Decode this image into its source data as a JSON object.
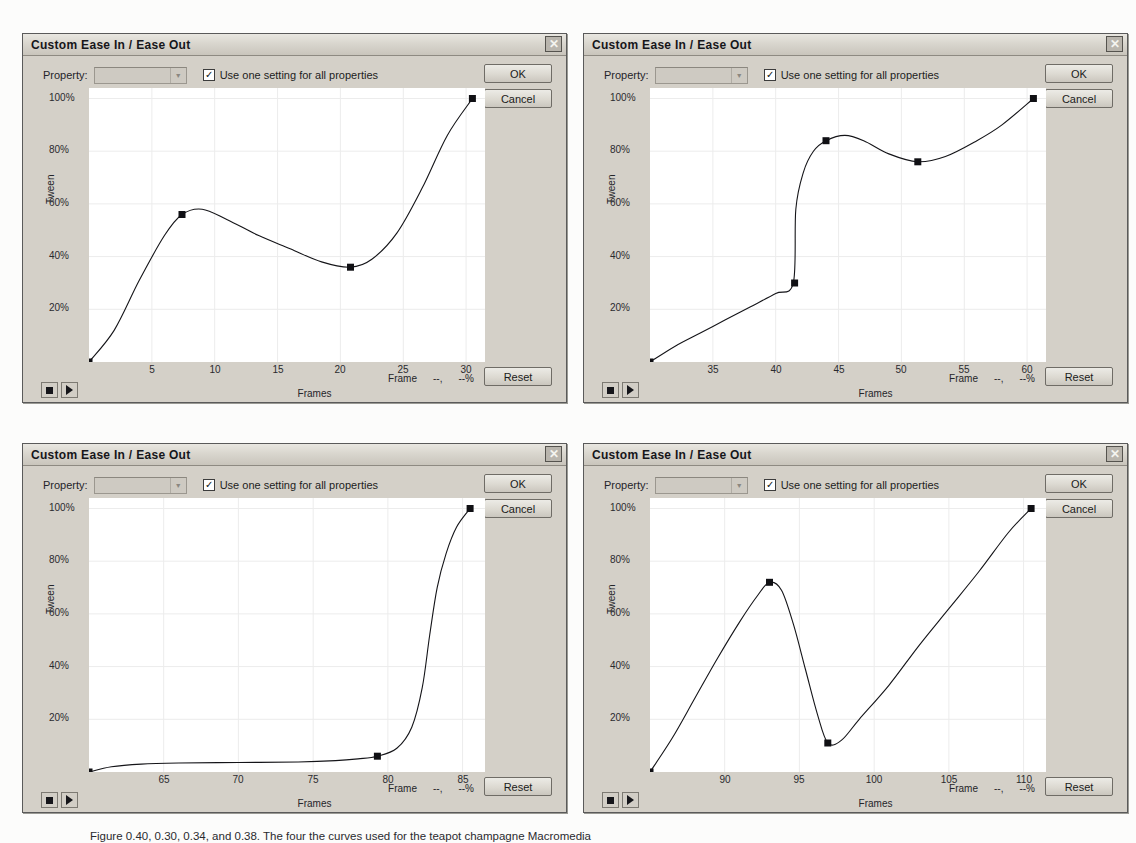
{
  "dialogs": [
    {
      "title": "Custom Ease In / Ease Out",
      "close_label": "✕",
      "property_label": "Property:",
      "property_value": "",
      "checkbox_label": "Use one setting for all properties",
      "checkbox_checked": true,
      "ok_label": "OK",
      "cancel_label": "Cancel",
      "reset_label": "Reset",
      "xlabel": "Frames",
      "ylabel": "Tween",
      "frame_readout_label": "Frame",
      "frame_readout_value": "--,",
      "percent_readout_value": "--%",
      "stop_icon": "stop-icon",
      "play_icon": "play-icon"
    },
    {
      "title": "Custom Ease In / Ease Out",
      "close_label": "✕",
      "property_label": "Property:",
      "property_value": "",
      "checkbox_label": "Use one setting for all properties",
      "checkbox_checked": true,
      "ok_label": "OK",
      "cancel_label": "Cancel",
      "reset_label": "Reset",
      "xlabel": "Frames",
      "ylabel": "Tween",
      "frame_readout_label": "Frame",
      "frame_readout_value": "--,",
      "percent_readout_value": "--%",
      "stop_icon": "stop-icon",
      "play_icon": "play-icon"
    },
    {
      "title": "Custom Ease In / Ease Out",
      "close_label": "✕",
      "property_label": "Property:",
      "property_value": "",
      "checkbox_label": "Use one setting for all properties",
      "checkbox_checked": true,
      "ok_label": "OK",
      "cancel_label": "Cancel",
      "reset_label": "Reset",
      "xlabel": "Frames",
      "ylabel": "Tween",
      "frame_readout_label": "Frame",
      "frame_readout_value": "--,",
      "percent_readout_value": "--%",
      "stop_icon": "stop-icon",
      "play_icon": "play-icon"
    },
    {
      "title": "Custom Ease In / Ease Out",
      "close_label": "✕",
      "property_label": "Property:",
      "property_value": "",
      "checkbox_label": "Use one setting for all properties",
      "checkbox_checked": true,
      "ok_label": "OK",
      "cancel_label": "Cancel",
      "reset_label": "Reset",
      "xlabel": "Frames",
      "ylabel": "Tween",
      "frame_readout_label": "Frame",
      "frame_readout_value": "--,",
      "percent_readout_value": "--%",
      "stop_icon": "stop-icon",
      "play_icon": "play-icon"
    }
  ],
  "caption": "Figure    0.40, 0.30, 0.34, and 0.38. The four the curves used for the teapot champagne Macromedia",
  "chart_data": [
    {
      "type": "line",
      "title": "Custom Ease In / Ease Out",
      "xlabel": "Frames",
      "ylabel": "Tween",
      "xlim": [
        0,
        31.5
      ],
      "ylim": [
        0,
        104
      ],
      "xticks": [
        5,
        10,
        15,
        20,
        25,
        30
      ],
      "yticks": [
        20,
        40,
        60,
        80,
        100
      ],
      "ytick_labels": [
        "20%",
        "40%",
        "60%",
        "80%",
        "100%"
      ],
      "grid": true,
      "legend": "none",
      "control_points": [
        {
          "frame": 0,
          "tween": 0
        },
        {
          "frame": 7.4,
          "tween": 56
        },
        {
          "frame": 20.8,
          "tween": 36
        },
        {
          "frame": 30.5,
          "tween": 100
        }
      ],
      "curve": [
        {
          "frame": 0,
          "tween": 0
        },
        {
          "frame": 2.0,
          "tween": 12
        },
        {
          "frame": 4.0,
          "tween": 31
        },
        {
          "frame": 6.0,
          "tween": 48
        },
        {
          "frame": 7.4,
          "tween": 56
        },
        {
          "frame": 9.0,
          "tween": 58
        },
        {
          "frame": 11.0,
          "tween": 54
        },
        {
          "frame": 13.5,
          "tween": 48
        },
        {
          "frame": 16.0,
          "tween": 43
        },
        {
          "frame": 18.5,
          "tween": 38
        },
        {
          "frame": 20.8,
          "tween": 36
        },
        {
          "frame": 22.5,
          "tween": 39
        },
        {
          "frame": 24.5,
          "tween": 49
        },
        {
          "frame": 26.5,
          "tween": 66
        },
        {
          "frame": 28.5,
          "tween": 86
        },
        {
          "frame": 30.5,
          "tween": 100
        }
      ]
    },
    {
      "type": "line",
      "title": "Custom Ease In / Ease Out",
      "xlabel": "Frames",
      "ylabel": "Tween",
      "xlim": [
        30,
        61.5
      ],
      "ylim": [
        0,
        104
      ],
      "xticks": [
        35,
        40,
        45,
        50,
        55,
        60
      ],
      "yticks": [
        20,
        40,
        60,
        80,
        100
      ],
      "ytick_labels": [
        "20%",
        "40%",
        "60%",
        "80%",
        "100%"
      ],
      "grid": true,
      "legend": "none",
      "control_points": [
        {
          "frame": 30,
          "tween": 0
        },
        {
          "frame": 41.5,
          "tween": 30
        },
        {
          "frame": 44.0,
          "tween": 84
        },
        {
          "frame": 51.3,
          "tween": 76
        },
        {
          "frame": 60.5,
          "tween": 100
        }
      ],
      "curve": [
        {
          "frame": 30,
          "tween": 0
        },
        {
          "frame": 32,
          "tween": 6
        },
        {
          "frame": 34,
          "tween": 11
        },
        {
          "frame": 36,
          "tween": 16
        },
        {
          "frame": 38,
          "tween": 21
        },
        {
          "frame": 40,
          "tween": 26
        },
        {
          "frame": 41.4,
          "tween": 30
        },
        {
          "frame": 41.6,
          "tween": 58
        },
        {
          "frame": 42.2,
          "tween": 72
        },
        {
          "frame": 43.0,
          "tween": 80
        },
        {
          "frame": 44.0,
          "tween": 84
        },
        {
          "frame": 45.5,
          "tween": 86
        },
        {
          "frame": 47.0,
          "tween": 84
        },
        {
          "frame": 49.0,
          "tween": 79
        },
        {
          "frame": 51.3,
          "tween": 76
        },
        {
          "frame": 53.5,
          "tween": 78
        },
        {
          "frame": 56.0,
          "tween": 84
        },
        {
          "frame": 58.0,
          "tween": 90
        },
        {
          "frame": 60.5,
          "tween": 100
        }
      ]
    },
    {
      "type": "line",
      "title": "Custom Ease In / Ease Out",
      "xlabel": "Frames",
      "ylabel": "Tween",
      "xlim": [
        60,
        86.5
      ],
      "ylim": [
        0,
        104
      ],
      "xticks": [
        65,
        70,
        75,
        80,
        85
      ],
      "yticks": [
        20,
        40,
        60,
        80,
        100
      ],
      "ytick_labels": [
        "20%",
        "40%",
        "60%",
        "80%",
        "100%"
      ],
      "grid": true,
      "legend": "none",
      "control_points": [
        {
          "frame": 60,
          "tween": 0
        },
        {
          "frame": 79.3,
          "tween": 6
        },
        {
          "frame": 85.5,
          "tween": 100
        }
      ],
      "curve": [
        {
          "frame": 60,
          "tween": 0
        },
        {
          "frame": 61.5,
          "tween": 2.0
        },
        {
          "frame": 63.5,
          "tween": 3.0
        },
        {
          "frame": 66,
          "tween": 3.4
        },
        {
          "frame": 70,
          "tween": 3.6
        },
        {
          "frame": 74,
          "tween": 3.8
        },
        {
          "frame": 76.5,
          "tween": 4.3
        },
        {
          "frame": 78,
          "tween": 5.0
        },
        {
          "frame": 79.3,
          "tween": 6.0
        },
        {
          "frame": 80.6,
          "tween": 9
        },
        {
          "frame": 81.6,
          "tween": 17
        },
        {
          "frame": 82.3,
          "tween": 32
        },
        {
          "frame": 82.8,
          "tween": 52
        },
        {
          "frame": 83.3,
          "tween": 70
        },
        {
          "frame": 83.9,
          "tween": 83
        },
        {
          "frame": 84.6,
          "tween": 93
        },
        {
          "frame": 85.5,
          "tween": 100
        }
      ]
    },
    {
      "type": "line",
      "title": "Custom Ease In / Ease Out",
      "xlabel": "Frames",
      "ylabel": "Tween",
      "xlim": [
        85,
        111.5
      ],
      "ylim": [
        0,
        104
      ],
      "xticks": [
        90,
        95,
        100,
        105,
        110
      ],
      "yticks": [
        20,
        40,
        60,
        80,
        100
      ],
      "ytick_labels": [
        "20%",
        "40%",
        "60%",
        "80%",
        "100%"
      ],
      "grid": true,
      "legend": "none",
      "control_points": [
        {
          "frame": 85,
          "tween": 0
        },
        {
          "frame": 93.0,
          "tween": 72
        },
        {
          "frame": 96.9,
          "tween": 11
        },
        {
          "frame": 110.5,
          "tween": 100
        }
      ],
      "curve": [
        {
          "frame": 85,
          "tween": 0
        },
        {
          "frame": 86.5,
          "tween": 13
        },
        {
          "frame": 88,
          "tween": 28
        },
        {
          "frame": 89.5,
          "tween": 43
        },
        {
          "frame": 91,
          "tween": 57
        },
        {
          "frame": 92.2,
          "tween": 67
        },
        {
          "frame": 93.0,
          "tween": 72
        },
        {
          "frame": 93.8,
          "tween": 69
        },
        {
          "frame": 94.6,
          "tween": 56
        },
        {
          "frame": 95.4,
          "tween": 39
        },
        {
          "frame": 96.2,
          "tween": 22
        },
        {
          "frame": 96.9,
          "tween": 11
        },
        {
          "frame": 97.8,
          "tween": 12
        },
        {
          "frame": 99,
          "tween": 20
        },
        {
          "frame": 101,
          "tween": 33
        },
        {
          "frame": 103,
          "tween": 48
        },
        {
          "frame": 105,
          "tween": 62
        },
        {
          "frame": 107,
          "tween": 76
        },
        {
          "frame": 109,
          "tween": 91
        },
        {
          "frame": 110.5,
          "tween": 100
        }
      ]
    }
  ]
}
